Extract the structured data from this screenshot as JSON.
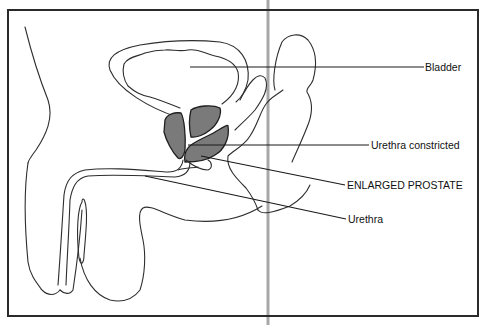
{
  "figure": {
    "type": "anatomical-illustration",
    "colors": {
      "background": "#ffffff",
      "line": "#2e2e2e",
      "prostate_fill": "#7a7a7a",
      "fold_line": "#a8a8a8"
    }
  },
  "labels": {
    "bladder": "Bladder",
    "urethra_constricted": "Urethra constricted",
    "enlarged_prostate": "ENLARGED PROSTATE",
    "urethra": "Urethra"
  }
}
